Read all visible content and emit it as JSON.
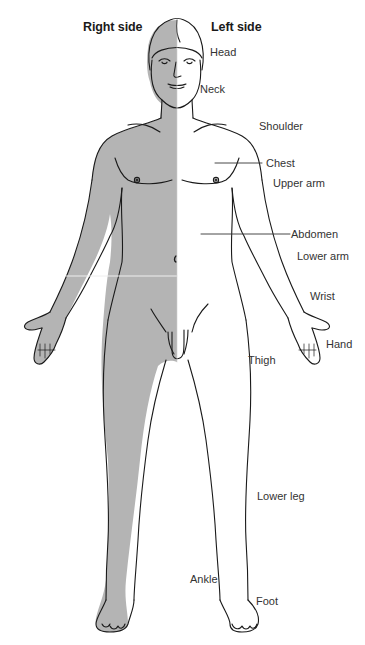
{
  "figure": {
    "colors": {
      "shade": "#b4b4b4",
      "outline": "#1a1a1a",
      "background": "#ffffff",
      "label": "#333333",
      "divider": "#eeeeee"
    },
    "headers": {
      "right_side": "Right side",
      "left_side": "Left side"
    },
    "labels": [
      {
        "id": "head",
        "text": "Head"
      },
      {
        "id": "neck",
        "text": "Neck"
      },
      {
        "id": "shoulder",
        "text": "Shoulder"
      },
      {
        "id": "chest",
        "text": "Chest"
      },
      {
        "id": "upper-arm",
        "text": "Upper arm"
      },
      {
        "id": "abdomen",
        "text": "Abdomen"
      },
      {
        "id": "lower-arm",
        "text": "Lower arm"
      },
      {
        "id": "wrist",
        "text": "Wrist"
      },
      {
        "id": "hand",
        "text": "Hand"
      },
      {
        "id": "thigh",
        "text": "Thigh"
      },
      {
        "id": "lower-leg",
        "text": "Lower leg"
      },
      {
        "id": "ankle",
        "text": "Ankle"
      },
      {
        "id": "foot",
        "text": "Foot"
      }
    ]
  }
}
